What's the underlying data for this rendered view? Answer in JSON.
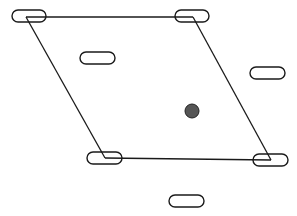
{
  "diagram": {
    "width": 297,
    "height": 216,
    "stroke_color": "#1a1a1a",
    "dot_color": "#555555",
    "pills": [
      {
        "id": "pill-top-left",
        "x": 12,
        "y": 10,
        "w": 34,
        "h": 12
      },
      {
        "id": "pill-top-right",
        "x": 175,
        "y": 10,
        "w": 34,
        "h": 12
      },
      {
        "id": "pill-inner-left",
        "x": 80,
        "y": 52,
        "w": 35,
        "h": 12
      },
      {
        "id": "pill-right",
        "x": 250,
        "y": 67,
        "w": 35,
        "h": 12
      },
      {
        "id": "pill-bottom-left",
        "x": 87,
        "y": 152,
        "w": 35,
        "h": 12
      },
      {
        "id": "pill-bottom-right",
        "x": 253,
        "y": 154,
        "w": 35,
        "h": 12
      },
      {
        "id": "pill-bottom",
        "x": 169,
        "y": 195,
        "w": 35,
        "h": 12
      }
    ],
    "edges": [
      {
        "x1": 26,
        "y1": 17,
        "x2": 193,
        "y2": 17
      },
      {
        "x1": 26,
        "y1": 17,
        "x2": 105,
        "y2": 158
      },
      {
        "x1": 193,
        "y1": 17,
        "x2": 271,
        "y2": 160
      },
      {
        "x1": 105,
        "y1": 158,
        "x2": 271,
        "y2": 160
      }
    ],
    "dot": {
      "cx": 192,
      "cy": 111,
      "r": 7
    }
  }
}
